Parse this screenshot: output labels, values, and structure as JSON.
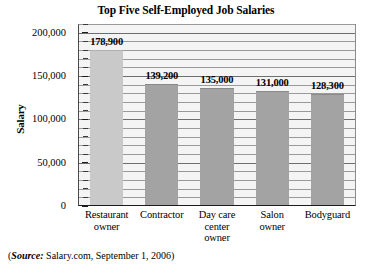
{
  "chart_data": {
    "type": "bar",
    "title": "Top Five Self-Employed Job Salaries",
    "xlabel": "",
    "ylabel": "Salary",
    "categories": [
      "Restaurant owner",
      "Contractor",
      "Day care center owner",
      "Salon owner",
      "Bodyguard"
    ],
    "values": [
      178900,
      139200,
      135000,
      131000,
      128300
    ],
    "value_labels": [
      "178,900",
      "139,200",
      "135,000",
      "131,000",
      "128,300"
    ],
    "ylim": [
      0,
      210000
    ],
    "ytick_values": [
      0,
      50000,
      100000,
      150000,
      200000
    ],
    "ytick_labels": [
      "0",
      "50,000",
      "100,000",
      "150,000",
      "200,000"
    ],
    "minor_tick_interval": 10000,
    "grid": true,
    "grid_orientation": "horizontal",
    "legend": "none",
    "bar_colors": [
      "#c9c9c9",
      "#a3a3a3",
      "#a3a3a3",
      "#a3a3a3",
      "#a3a3a3"
    ],
    "plot_background": "#f4f4f4"
  },
  "category_lines": [
    [
      "Restaurant",
      "owner"
    ],
    [
      "Contractor"
    ],
    [
      "Day care",
      "center",
      "owner"
    ],
    [
      "Salon",
      "owner"
    ],
    [
      "Bodyguard"
    ]
  ],
  "source": {
    "open_paren": "(",
    "label": "Source:",
    "text": " Salary.com, September 1, 2006)"
  }
}
